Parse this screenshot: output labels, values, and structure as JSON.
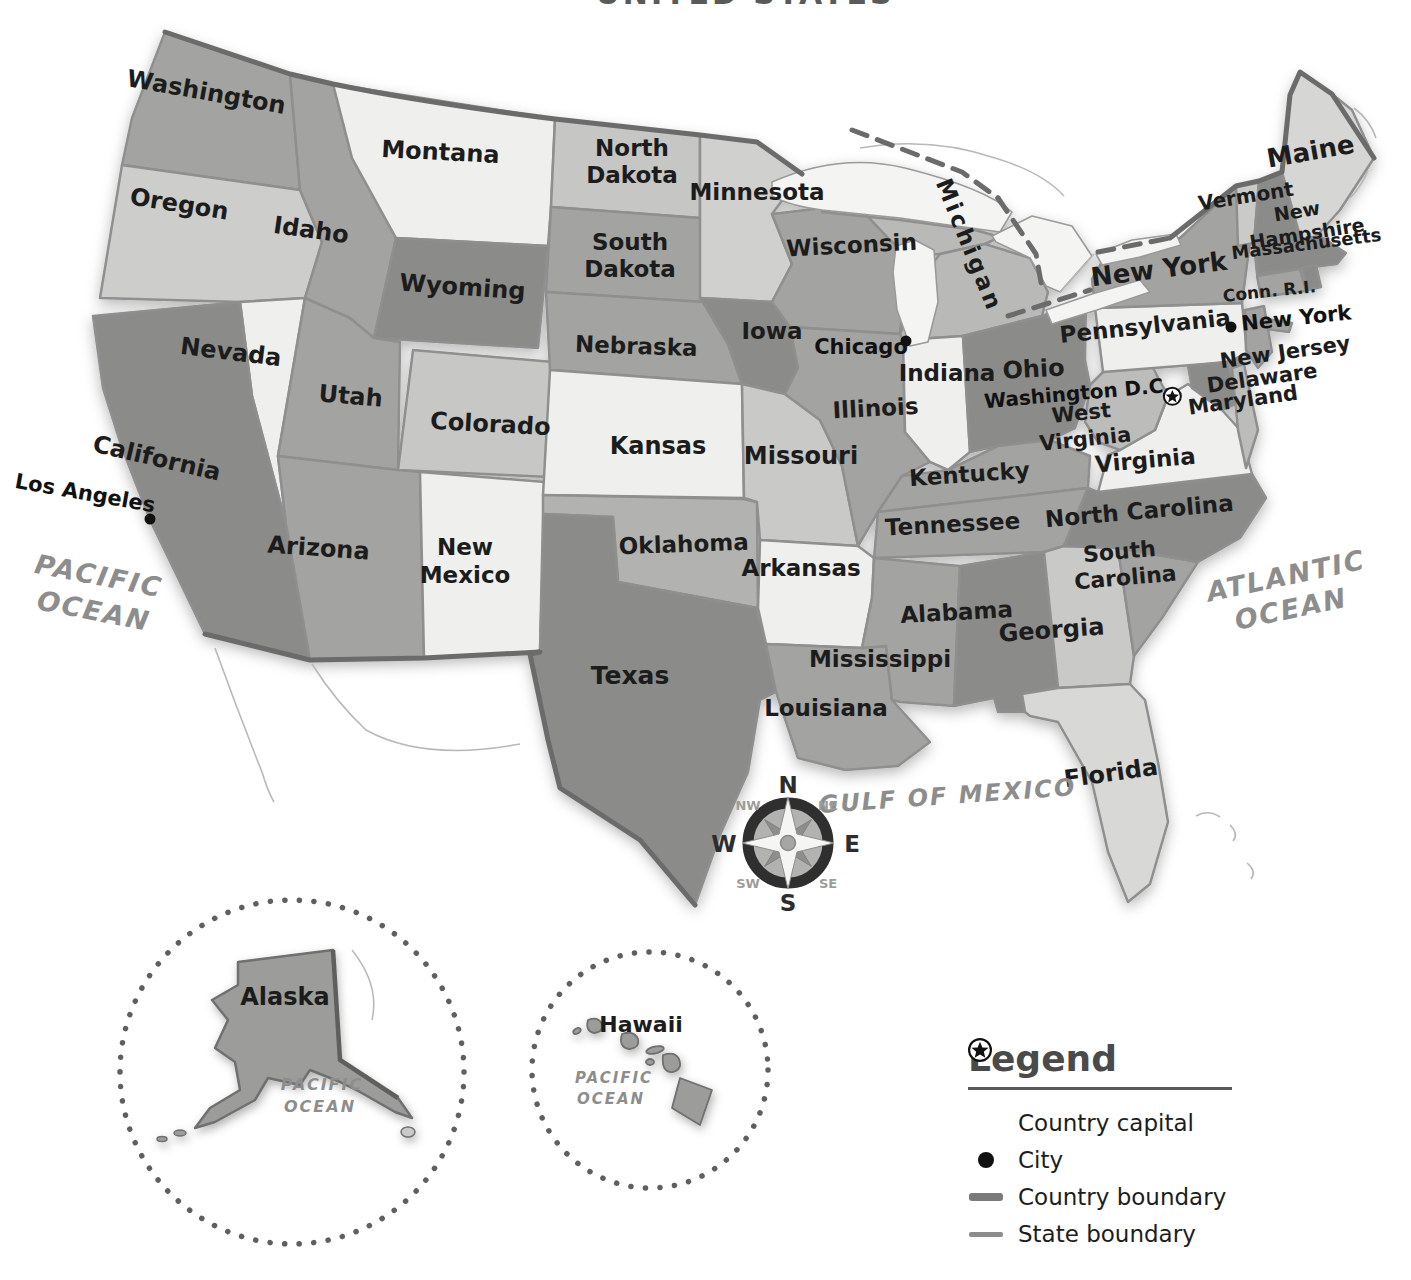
{
  "title": "UNITED STATES",
  "map": {
    "state_labels": {
      "washington": "Washington",
      "oregon": "Oregon",
      "idaho": "Idaho",
      "montana": "Montana",
      "wyoming": "Wyoming",
      "north_dakota_1": "North",
      "north_dakota_2": "Dakota",
      "south_dakota_1": "South",
      "south_dakota_2": "Dakota",
      "minnesota": "Minnesota",
      "wisconsin": "Wisconsin",
      "michigan": "Michigan",
      "nevada": "Nevada",
      "utah": "Utah",
      "colorado": "Colorado",
      "california": "California",
      "arizona": "Arizona",
      "new_mexico_1": "New",
      "new_mexico_2": "Mexico",
      "nebraska": "Nebraska",
      "iowa": "Iowa",
      "kansas": "Kansas",
      "missouri": "Missouri",
      "illinois": "Illinois",
      "indiana": "Indiana",
      "ohio": "Ohio",
      "kentucky": "Kentucky",
      "tennessee": "Tennessee",
      "west_virginia_1": "West",
      "west_virginia_2": "Virginia",
      "virginia": "Virginia",
      "north_carolina": "North Carolina",
      "south_carolina_1": "South",
      "south_carolina_2": "Carolina",
      "georgia": "Georgia",
      "florida": "Florida",
      "alabama": "Alabama",
      "mississippi": "Mississippi",
      "louisiana": "Louisiana",
      "arkansas": "Arkansas",
      "oklahoma": "Oklahoma",
      "texas": "Texas",
      "new_york": "New York",
      "pennsylvania": "Pennsylvania",
      "maine": "Maine",
      "vermont": "Vermont",
      "new_hampshire_1": "New",
      "new_hampshire_2": "Hampshire",
      "massachusetts": "Massachusetts",
      "conn_ri": "Conn. R.I.",
      "new_jersey": "New Jersey",
      "delaware": "Delaware",
      "maryland": "Maryland"
    },
    "cities": {
      "los_angeles": "Los Angeles",
      "chicago": "Chicago",
      "new_york_city": "New York",
      "washington_dc": "Washington D.C."
    },
    "oceans": {
      "pacific_1": "PACIFIC",
      "pacific_2": "OCEAN",
      "atlantic_1": "ATLANTIC",
      "atlantic_2": "OCEAN",
      "gulf": "GULF OF MEXICO"
    },
    "compass": {
      "n": "N",
      "e": "E",
      "s": "S",
      "w": "W",
      "ne": "NE",
      "nw": "NW",
      "se": "SE",
      "sw": "SW"
    }
  },
  "insets": {
    "alaska": {
      "label": "Alaska",
      "ocean_1": "PACIFIC",
      "ocean_2": "OCEAN"
    },
    "hawaii": {
      "label": "Hawaii",
      "ocean_1": "PACIFIC",
      "ocean_2": "OCEAN"
    }
  },
  "legend": {
    "title": "Legend",
    "items": [
      {
        "label": "Country capital",
        "icon": "capital-star-icon"
      },
      {
        "label": "City",
        "icon": "city-dot-icon"
      },
      {
        "label": "Country boundary",
        "icon": "country-boundary-line-icon"
      },
      {
        "label": "State boundary",
        "icon": "state-boundary-line-icon"
      }
    ]
  },
  "colors": {
    "state_dark": "#8b8b89",
    "state_medium": "#a3a3a1",
    "state_mlight": "#bcbcba",
    "state_light": "#cfcfcd",
    "state_xlight": "#efefed",
    "lake": "#f4f4f2",
    "boundary_country": "#6b6b6b",
    "boundary_state": "#8f8f8f",
    "label": "#1c1c1c",
    "ocean_label": "#8d8d8d",
    "city_dot": "#111111"
  }
}
